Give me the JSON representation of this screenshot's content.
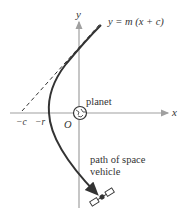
{
  "diagram": {
    "axis_labels": {
      "x": "x",
      "y": "y"
    },
    "asymptote_label": "y = m (x + c)",
    "planet_label": "planet",
    "origin_label": "O",
    "tick_labels": {
      "neg_c": "−c",
      "neg_r": "−r"
    },
    "path_label_line1": "path of space",
    "path_label_line2": "vehicle",
    "colors": {
      "axis": "#9a9a9a",
      "curve": "#333333",
      "text": "#333333"
    }
  }
}
